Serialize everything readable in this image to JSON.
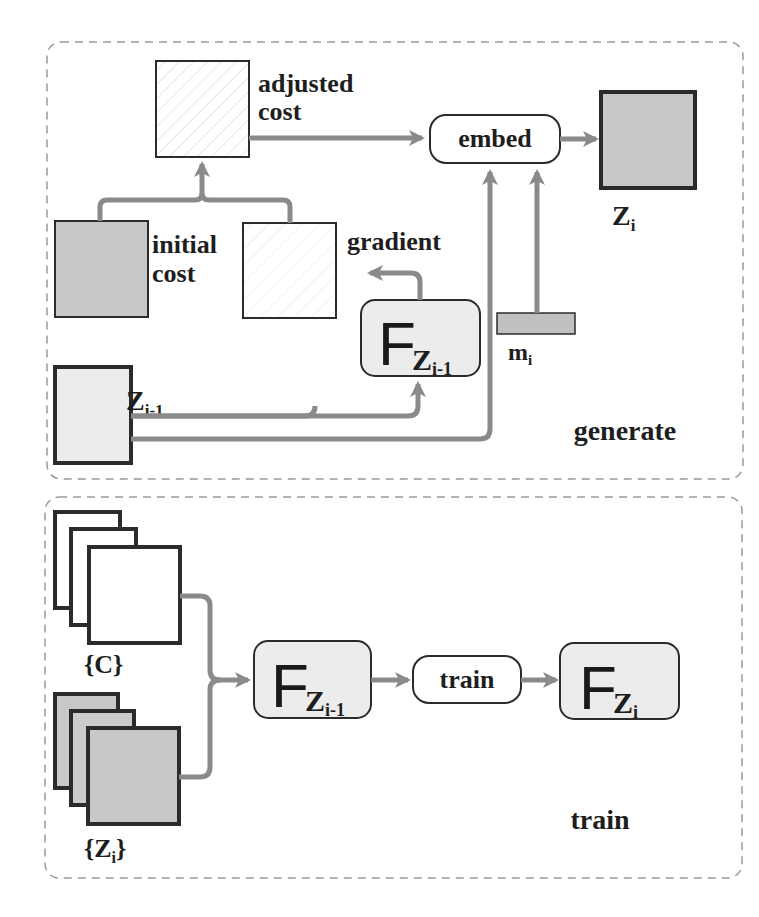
{
  "colors": {
    "arrow": "#8a8a8a",
    "border_dark": "#2b2b2b",
    "fill_gray": "#c8c8c8",
    "fill_light": "#ececec",
    "dash": "#9a9a9a"
  },
  "generate_panel": {
    "title": "generate",
    "adjusted_cost": {
      "line1": "adjusted",
      "line2": "cost"
    },
    "initial_cost": {
      "line1": "initial",
      "line2": "cost"
    },
    "gradient": "gradient",
    "embed": "embed",
    "output": {
      "main": "Z",
      "sub": "i"
    },
    "previous": {
      "main": "Z",
      "sub": "i-1"
    },
    "model": {
      "letter": "F",
      "main": "Z",
      "sub": "i-1"
    },
    "message": {
      "main": "m",
      "sub": "i"
    }
  },
  "train_panel": {
    "title": "train",
    "covers": {
      "label": "{C}"
    },
    "stegos": {
      "open": "{",
      "main": "Z",
      "sub": "i",
      "close": "}"
    },
    "model_in": {
      "letter": "F",
      "main": "Z",
      "sub": "i-1"
    },
    "train_box": "train",
    "model_out": {
      "letter": "F",
      "main": "Z",
      "sub": "i"
    }
  }
}
